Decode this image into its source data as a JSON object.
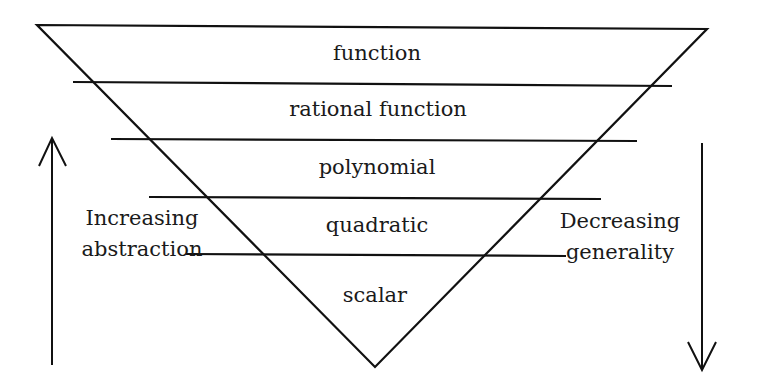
{
  "diagram": {
    "type": "inverted-pyramid",
    "levels": [
      {
        "label": "function"
      },
      {
        "label": "rational function"
      },
      {
        "label": "polynomial"
      },
      {
        "label": "quadratic"
      },
      {
        "label": "scalar"
      }
    ],
    "left_annotation": {
      "line1": "Increasing",
      "line2": "abstraction",
      "arrow_direction": "up"
    },
    "right_annotation": {
      "line1": "Decreasing",
      "line2": "generality",
      "arrow_direction": "down"
    },
    "colors": {
      "stroke": "#111111",
      "text": "#1a1a1a",
      "background": "#ffffff"
    }
  }
}
